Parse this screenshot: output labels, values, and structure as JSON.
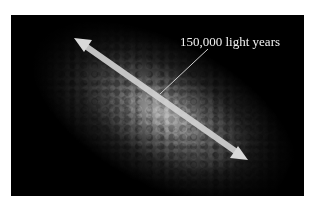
{
  "figure": {
    "annotation_label": "150,000 light years",
    "arrow": {
      "from": [
        74,
        38
      ],
      "to": [
        248,
        160
      ],
      "color": "#d9d9d9"
    },
    "leader_line": {
      "from": [
        208,
        49
      ],
      "to": [
        160,
        94
      ],
      "color": "#cfcfcf"
    },
    "colors": {
      "background": "#ffffff",
      "photo_background": "#000000"
    }
  },
  "top_caption_clipped": ""
}
